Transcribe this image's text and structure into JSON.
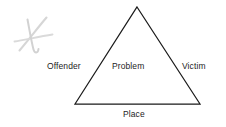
{
  "diagram": {
    "type": "triangle-diagram",
    "background_color": "#ffffff",
    "stroke_color": "#1a1a1a",
    "text_color": "#1d1d1d",
    "annotation_color": "#d4d4d4",
    "labels": {
      "offender": "Offender",
      "problem": "Problem",
      "victim": "Victim",
      "place": "Place"
    },
    "annotation": {
      "name": "handwritten-x-mark",
      "description": "faint gray handwritten cross mark"
    }
  }
}
